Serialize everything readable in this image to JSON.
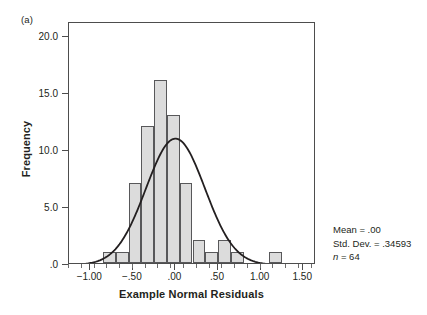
{
  "figure": {
    "panel_label": "(a)"
  },
  "annotations": {
    "mean": "Mean = .00",
    "std_dev": "Std. Dev. = .34593",
    "n_symbol": "n",
    "n_value": " = 64"
  },
  "chart_data": {
    "type": "bar",
    "subtype": "histogram-with-normal-curve",
    "title": "",
    "xlabel": "Example Normal Residuals",
    "ylabel": "Frequency",
    "xlim": [
      -1.25,
      1.65
    ],
    "ylim": [
      0,
      21.2
    ],
    "grid": false,
    "legend": null,
    "x_tick_labels": [
      "-1.00",
      "-.50",
      ".00",
      ".50",
      "1.00",
      "1.50"
    ],
    "x_tick_values": [
      -1.0,
      -0.5,
      0.0,
      0.5,
      1.0,
      1.5
    ],
    "y_tick_labels": [
      "20.0",
      "15.0",
      "10.0",
      "5.0",
      ".0"
    ],
    "y_tick_values": [
      20,
      15,
      10,
      5,
      0
    ],
    "bin_width": 0.15,
    "bin_starts": [
      -0.85,
      -0.7,
      -0.55,
      -0.4,
      -0.25,
      -0.1,
      0.05,
      0.2,
      0.35,
      0.5,
      0.65,
      0.8,
      0.95,
      1.1
    ],
    "values": [
      1,
      1,
      7,
      12,
      16,
      13,
      7,
      2,
      1,
      2,
      1,
      0,
      0,
      1
    ],
    "bar_fill": "#dcdcdc",
    "bar_stroke": "#58585a",
    "curve_color": "#231f20",
    "normal_curve": {
      "mean": 0.0,
      "std_dev": 0.34593,
      "n": 64,
      "peak_frequency": 12.3
    }
  }
}
